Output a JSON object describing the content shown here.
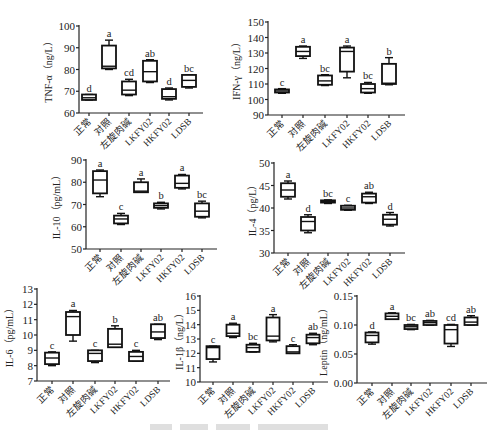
{
  "chart_data": [
    {
      "type": "box",
      "title": "",
      "ylabel": "TNF-α（ng/L）",
      "xlabel": "",
      "ylim": [
        60,
        100
      ],
      "yticks": [
        60,
        70,
        80,
        90,
        100
      ],
      "categories": [
        "正常",
        "对照",
        "左旋肉碱",
        "LKFY02",
        "HKFY02",
        "LDSB"
      ],
      "boxes": [
        {
          "min": 66,
          "q1": 66,
          "median": 67,
          "q3": 68.5,
          "max": 68.5,
          "sig": "d"
        },
        {
          "min": 80,
          "q1": 80.5,
          "median": 81.5,
          "q3": 91,
          "max": 93.5,
          "sig": "a"
        },
        {
          "min": 68,
          "q1": 68.5,
          "median": 70.5,
          "q3": 74.5,
          "max": 75.5,
          "sig": "cd"
        },
        {
          "min": 74,
          "q1": 74.5,
          "median": 79,
          "q3": 84,
          "max": 84.5,
          "sig": "ab"
        },
        {
          "min": 66,
          "q1": 66.5,
          "median": 67.5,
          "q3": 71,
          "max": 71.5,
          "sig": "d"
        },
        {
          "min": 71.5,
          "q1": 72,
          "median": 75,
          "q3": 77.5,
          "max": 77.5,
          "sig": "bc"
        }
      ]
    },
    {
      "type": "box",
      "title": "",
      "ylabel": "IFN-γ（ng/L）",
      "xlabel": "",
      "ylim": [
        90,
        150
      ],
      "yticks": [
        90,
        100,
        110,
        120,
        130,
        140,
        150
      ],
      "categories": [
        "正常",
        "对照",
        "左旋肉碱",
        "LKFY02",
        "HKFY02",
        "LDSB"
      ],
      "boxes": [
        {
          "min": 104,
          "q1": 104.5,
          "median": 105.5,
          "q3": 106.5,
          "max": 107,
          "sig": "c"
        },
        {
          "min": 126.5,
          "q1": 128,
          "median": 131,
          "q3": 134,
          "max": 134.5,
          "sig": "a"
        },
        {
          "min": 109,
          "q1": 109.5,
          "median": 112,
          "q3": 115.5,
          "max": 116,
          "sig": "bc"
        },
        {
          "min": 114,
          "q1": 118,
          "median": 131,
          "q3": 133.5,
          "max": 134.5,
          "sig": "a"
        },
        {
          "min": 104,
          "q1": 104.5,
          "median": 107,
          "q3": 110,
          "max": 111,
          "sig": "bc"
        },
        {
          "min": 109.5,
          "q1": 110,
          "median": 110.5,
          "q3": 123,
          "max": 127,
          "sig": "b"
        }
      ]
    },
    {
      "type": "box",
      "title": "",
      "ylabel": "IL-10（pg/mL）",
      "xlabel": "",
      "ylim": [
        50,
        90
      ],
      "yticks": [
        50,
        60,
        70,
        80,
        90
      ],
      "categories": [
        "正常",
        "对照",
        "左旋肉碱",
        "LKFY02",
        "HKFY02",
        "LDSB"
      ],
      "boxes": [
        {
          "min": 73.5,
          "q1": 75,
          "median": 81,
          "q3": 85,
          "max": 85.5,
          "sig": "a"
        },
        {
          "min": 61,
          "q1": 61.5,
          "median": 63.5,
          "q3": 65,
          "max": 66,
          "sig": "c"
        },
        {
          "min": 75.5,
          "q1": 75.5,
          "median": 76,
          "q3": 80,
          "max": 81.5,
          "sig": "a"
        },
        {
          "min": 68,
          "q1": 68.5,
          "median": 69.5,
          "q3": 70.5,
          "max": 71,
          "sig": "b"
        },
        {
          "min": 77,
          "q1": 77.5,
          "median": 79.5,
          "q3": 83,
          "max": 83.5,
          "sig": "a"
        },
        {
          "min": 64,
          "q1": 64.5,
          "median": 67,
          "q3": 70.5,
          "max": 71.5,
          "sig": "bc"
        }
      ]
    },
    {
      "type": "box",
      "title": "",
      "ylabel": "IL-4（pg/L）",
      "xlabel": "",
      "ylim": [
        30,
        50
      ],
      "yticks": [
        30,
        35,
        40,
        45,
        50
      ],
      "categories": [
        "正常",
        "对照",
        "左旋肉碱",
        "LKFY02",
        "HKFY02",
        "LDSB"
      ],
      "boxes": [
        {
          "min": 42,
          "q1": 42.5,
          "median": 44,
          "q3": 45.5,
          "max": 46,
          "sig": "a"
        },
        {
          "min": 34.5,
          "q1": 35,
          "median": 37,
          "q3": 38,
          "max": 38.5,
          "sig": "d"
        },
        {
          "min": 41,
          "q1": 41.2,
          "median": 41.4,
          "q3": 41.7,
          "max": 41.8,
          "sig": "bc"
        },
        {
          "min": 39.5,
          "q1": 39.6,
          "median": 40,
          "q3": 40.5,
          "max": 40.6,
          "sig": "c"
        },
        {
          "min": 41,
          "q1": 41.2,
          "median": 42.5,
          "q3": 43.2,
          "max": 43.5,
          "sig": "ab"
        },
        {
          "min": 36,
          "q1": 36.3,
          "median": 37.5,
          "q3": 38.5,
          "max": 39,
          "sig": "d"
        }
      ]
    },
    {
      "type": "box",
      "title": "",
      "ylabel": "IL-6（pg/mL）",
      "xlabel": "",
      "ylim": [
        7,
        13
      ],
      "yticks": [
        7,
        8,
        9,
        10,
        11,
        12,
        13
      ],
      "categories": [
        "正常",
        "对照",
        "左旋肉碱",
        "LKFY02",
        "HKFY02",
        "LDSB"
      ],
      "boxes": [
        {
          "min": 8,
          "q1": 8.1,
          "median": 8.5,
          "q3": 8.85,
          "max": 8.9,
          "sig": "c"
        },
        {
          "min": 9.6,
          "q1": 10,
          "median": 11.2,
          "q3": 11.5,
          "max": 11.6,
          "sig": "a"
        },
        {
          "min": 8.2,
          "q1": 8.3,
          "median": 8.8,
          "q3": 9,
          "max": 9,
          "sig": "c"
        },
        {
          "min": 9.2,
          "q1": 9.2,
          "median": 9.4,
          "q3": 10.4,
          "max": 10.6,
          "sig": "b"
        },
        {
          "min": 8.3,
          "q1": 8.3,
          "median": 8.6,
          "q3": 8.9,
          "max": 9,
          "sig": "c"
        },
        {
          "min": 9.7,
          "q1": 9.8,
          "median": 10.2,
          "q3": 10.7,
          "max": 10.7,
          "sig": "ab"
        }
      ]
    },
    {
      "type": "box",
      "title": "",
      "ylabel": "IL-1β（ng/L）",
      "xlabel": "",
      "ylim": [
        10,
        16
      ],
      "yticks": [
        10,
        11,
        12,
        13,
        14,
        15,
        16
      ],
      "categories": [
        "正常",
        "对照",
        "左旋肉碱",
        "LKFY02",
        "HKFY02",
        "LDSB"
      ],
      "boxes": [
        {
          "min": 11.4,
          "q1": 11.6,
          "median": 12.4,
          "q3": 12.5,
          "max": 12.5,
          "sig": "c"
        },
        {
          "min": 13.1,
          "q1": 13.2,
          "median": 13.4,
          "q3": 14,
          "max": 14.1,
          "sig": "a"
        },
        {
          "min": 12.1,
          "q1": 12.1,
          "median": 12.4,
          "q3": 12.6,
          "max": 12.7,
          "sig": "bc"
        },
        {
          "min": 12.8,
          "q1": 12.9,
          "median": 13.2,
          "q3": 14.5,
          "max": 14.7,
          "sig": "a"
        },
        {
          "min": 12,
          "q1": 12,
          "median": 12.1,
          "q3": 12.5,
          "max": 12.6,
          "sig": "c"
        },
        {
          "min": 12.6,
          "q1": 12.7,
          "median": 13.1,
          "q3": 13.3,
          "max": 13.4,
          "sig": "ab"
        }
      ]
    },
    {
      "type": "box",
      "title": "",
      "ylabel": "Leptin（ng/mL）",
      "xlabel": "",
      "ylim": [
        0.0,
        0.15
      ],
      "yticks": [
        "0.00",
        "0.05",
        "0.10",
        "0.15"
      ],
      "categories": [
        "正常",
        "对照",
        "左旋肉碱",
        "LKFY02",
        "HKFY02",
        "LDSB"
      ],
      "boxes": [
        {
          "min": 0.067,
          "q1": 0.07,
          "median": 0.082,
          "q3": 0.087,
          "max": 0.088,
          "sig": "d"
        },
        {
          "min": 0.11,
          "q1": 0.11,
          "median": 0.115,
          "q3": 0.12,
          "max": 0.121,
          "sig": "a"
        },
        {
          "min": 0.092,
          "q1": 0.093,
          "median": 0.097,
          "q3": 0.1,
          "max": 0.101,
          "sig": "bc"
        },
        {
          "min": 0.1,
          "q1": 0.1,
          "median": 0.104,
          "q3": 0.107,
          "max": 0.108,
          "sig": "ab"
        },
        {
          "min": 0.063,
          "q1": 0.068,
          "median": 0.092,
          "q3": 0.1,
          "max": 0.101,
          "sig": "cd"
        },
        {
          "min": 0.1,
          "q1": 0.1,
          "median": 0.105,
          "q3": 0.113,
          "max": 0.116,
          "sig": "ab"
        }
      ]
    }
  ]
}
